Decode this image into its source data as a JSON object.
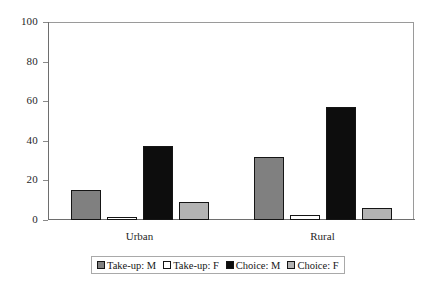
{
  "chart_data": {
    "type": "bar",
    "title": "",
    "subtitle": "",
    "xlabel": "",
    "ylabel": "",
    "categories": [
      "Urban",
      "Rural"
    ],
    "series": [
      {
        "name": "Take-up: M",
        "color": "#808080",
        "values": [
          15,
          32
        ]
      },
      {
        "name": "Take-up: F",
        "color": "#ffffff",
        "values": [
          1.5,
          2.5
        ]
      },
      {
        "name": "Choice: M",
        "color": "#0d0d0d",
        "values": [
          37.5,
          57
        ]
      },
      {
        "name": "Choice: F",
        "color": "#b3b3b3",
        "values": [
          9,
          6
        ]
      }
    ],
    "ylim": [
      0,
      100
    ],
    "yticks": [
      0,
      20,
      40,
      60,
      80,
      100
    ],
    "ytick_labels": [
      "0",
      "20",
      "40",
      "60",
      "80",
      "100"
    ],
    "grid": false,
    "legend_position": "bottom",
    "bar_border_color": "#151515",
    "axis_color": "#6e6e6e",
    "plot_border_color": "#9a9a9a",
    "background": "#ffffff"
  },
  "axis": {
    "y": {
      "labels": [
        "100",
        "80",
        "60",
        "40",
        "20",
        "0"
      ]
    },
    "x": {
      "labels": [
        "Urban",
        "Rural"
      ]
    }
  },
  "legend": {
    "items": [
      {
        "label": "Take-up: M"
      },
      {
        "label": "Take-up: F"
      },
      {
        "label": "Choice: M"
      },
      {
        "label": "Choice: F"
      }
    ]
  }
}
